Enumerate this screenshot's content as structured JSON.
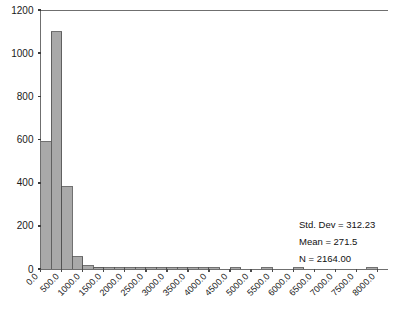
{
  "chart_data": {
    "type": "bar",
    "title": "",
    "subtitle": "",
    "xlabel": "",
    "ylabel": "",
    "grid": false,
    "legend_position": "none",
    "xlim": [
      0,
      8250
    ],
    "ylim": [
      0,
      1200
    ],
    "bin_width": 250,
    "x_tick_labels": [
      "0.0",
      "500.0",
      "1000.0",
      "1500.0",
      "2000.0",
      "2500.0",
      "3000.0",
      "3500.0",
      "4000.0",
      "4500.0",
      "5000.0",
      "5500.0",
      "6000.0",
      "6500.0",
      "7000.0",
      "7500.0",
      "8000.0"
    ],
    "x_tick_values": [
      0,
      500,
      1000,
      1500,
      2000,
      2500,
      3000,
      3500,
      4000,
      4500,
      5000,
      5500,
      6000,
      6500,
      7000,
      7500,
      8000
    ],
    "y_tick_labels": [
      "0",
      "200",
      "400",
      "600",
      "800",
      "1000",
      "1200"
    ],
    "y_tick_values": [
      0,
      200,
      400,
      600,
      800,
      1000,
      1200
    ],
    "bin_centers": [
      125,
      375,
      625,
      875,
      1125,
      1375,
      1625,
      1875,
      2125,
      2375,
      2625,
      2875,
      3125,
      3375,
      3625,
      3875,
      4125,
      4375,
      4625,
      4875,
      5125,
      5375,
      5625,
      5875,
      6125,
      6375,
      6625,
      6875,
      7125,
      7375,
      7625,
      7875
    ],
    "values": [
      590,
      1100,
      380,
      57,
      16,
      7,
      4,
      3,
      2,
      2,
      1,
      1,
      1,
      1,
      1,
      1,
      1,
      0,
      1,
      0,
      0,
      1,
      0,
      0,
      1,
      0,
      0,
      0,
      0,
      0,
      0,
      1
    ],
    "bar_fill": "#a9a9a9",
    "bar_stroke": "#4d4d4d",
    "axis_color": "#6f6f6f"
  },
  "stats": {
    "std_dev": "Std. Dev = 312.23",
    "mean": "Mean = 271.5",
    "n": "N = 2164.00"
  }
}
